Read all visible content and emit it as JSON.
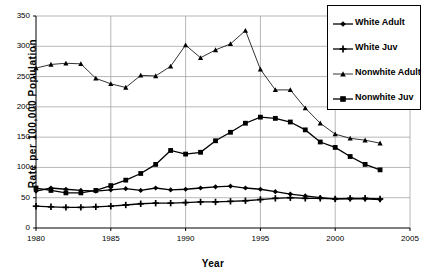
{
  "chart_data": {
    "type": "line",
    "title": "",
    "xlabel": "Year",
    "ylabel": "Rate per 100,000 Population",
    "xlim": [
      1980,
      2005
    ],
    "ylim": [
      0,
      350
    ],
    "xticks": [
      1980,
      1985,
      1990,
      1995,
      2000,
      2005
    ],
    "yticks": [
      0,
      50,
      100,
      150,
      200,
      250,
      300,
      350
    ],
    "grid": true,
    "legend_position": "top-right",
    "x": [
      1980,
      1981,
      1982,
      1983,
      1984,
      1985,
      1986,
      1987,
      1988,
      1989,
      1990,
      1991,
      1992,
      1993,
      1994,
      1995,
      1996,
      1997,
      1998,
      1999,
      2000,
      2001,
      2002,
      2003
    ],
    "series": [
      {
        "name": "White Adult",
        "marker": "diamond",
        "values": [
          61,
          66,
          64,
          62,
          61,
          63,
          65,
          62,
          66,
          63,
          64,
          66,
          68,
          69,
          66,
          64,
          60,
          56,
          53,
          50,
          48,
          48,
          48,
          47
        ]
      },
      {
        "name": "White Juv",
        "marker": "plus",
        "values": [
          36,
          35,
          34,
          34,
          35,
          36,
          38,
          40,
          41,
          41,
          42,
          43,
          43,
          44,
          45,
          47,
          49,
          50,
          49,
          49,
          48,
          49,
          49,
          48
        ]
      },
      {
        "name": "Nonwhite Adult",
        "marker": "triangle",
        "values": [
          264,
          270,
          272,
          271,
          247,
          238,
          232,
          252,
          251,
          267,
          302,
          281,
          294,
          304,
          326,
          262,
          228,
          228,
          198,
          173,
          155,
          148,
          145,
          140
        ]
      },
      {
        "name": "Nonwhite Juv",
        "marker": "square",
        "values": [
          66,
          62,
          58,
          58,
          62,
          70,
          79,
          90,
          105,
          128,
          122,
          125,
          144,
          158,
          173,
          183,
          181,
          175,
          162,
          142,
          133,
          118,
          105,
          96
        ]
      }
    ]
  },
  "legend": {
    "items": [
      {
        "label": "White Adult"
      },
      {
        "label": "White Juv"
      },
      {
        "label": "Nonwhite Adult"
      },
      {
        "label": "Nonwhite Juv"
      }
    ]
  },
  "axes": {
    "y_title": "Rate per 100,000 Population",
    "x_title": "Year",
    "y_tick_labels": [
      "0",
      "50",
      "100",
      "150",
      "200",
      "250",
      "300",
      "350"
    ],
    "x_tick_labels": [
      "1980",
      "1985",
      "1990",
      "1995",
      "2000",
      "2005"
    ]
  }
}
